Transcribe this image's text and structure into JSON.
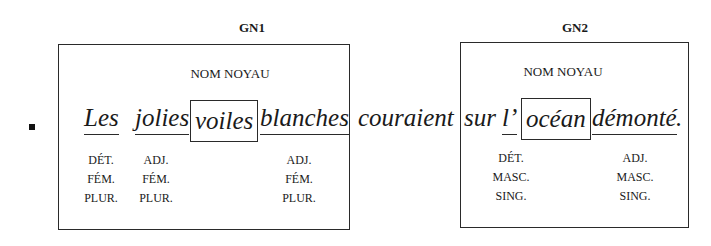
{
  "bullet": "■",
  "gn1": {
    "title": "GN1",
    "noyau_label": "NOM NOYAU",
    "words": [
      {
        "text": "Les",
        "role": "underlined",
        "features": [
          "DÉT.",
          "FÉM.",
          "PLUR."
        ]
      },
      {
        "text": "jolies",
        "role": "underlined",
        "features": [
          "ADJ.",
          "FÉM.",
          "PLUR."
        ]
      },
      {
        "text": "voiles",
        "role": "core",
        "features": []
      },
      {
        "text": "blanches",
        "role": "underlined",
        "features": [
          "ADJ.",
          "FÉM.",
          "PLUR."
        ]
      }
    ]
  },
  "verb": "couraient",
  "gn2": {
    "title": "GN2",
    "noyau_label": "NOM NOYAU",
    "words": [
      {
        "text": "sur",
        "role": "plain",
        "features": []
      },
      {
        "text": "l’",
        "role": "underlined",
        "features": [
          "DÉT.",
          "MASC.",
          "SING."
        ]
      },
      {
        "text": "océan",
        "role": "core",
        "features": []
      },
      {
        "text": "démonté",
        "role": "underlined",
        "features": [
          "ADJ.",
          "MASC.",
          "SING."
        ]
      }
    ],
    "final_punct": "."
  }
}
